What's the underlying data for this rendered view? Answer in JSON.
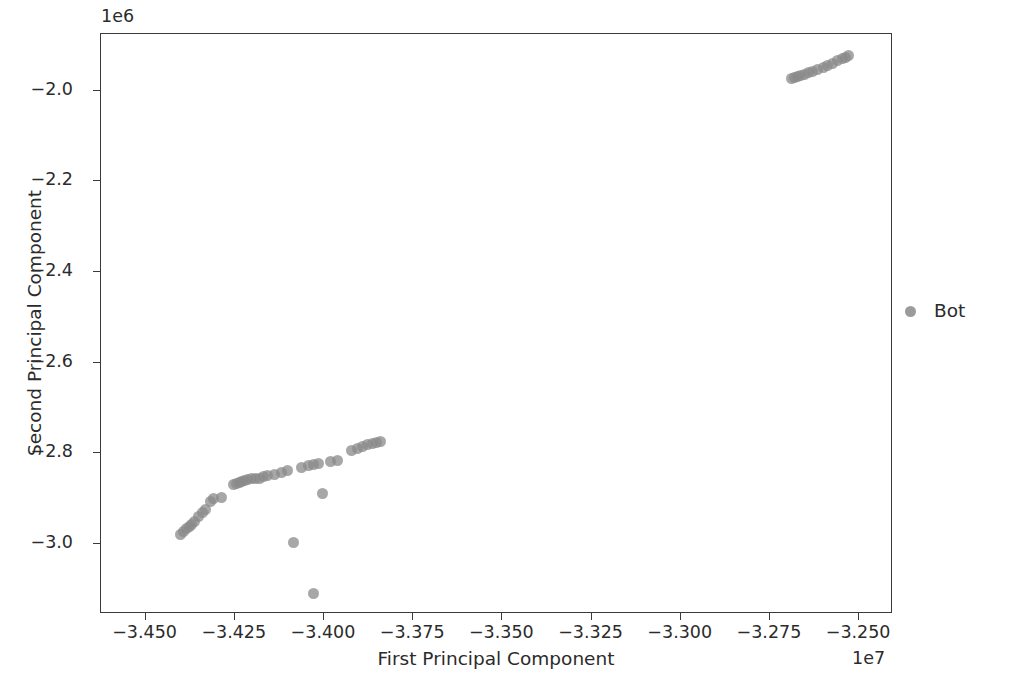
{
  "figure": {
    "background_color": "#ffffff",
    "axes_color": "#3a3a3a",
    "marker_color": "#8a8a8a"
  },
  "axis": {
    "x_title": "First Principal Component",
    "y_title": "Second Principal Component",
    "x_offset_text": "1e7",
    "y_offset_text": "1e6"
  },
  "legend": {
    "entries": [
      {
        "label": "Bot",
        "marker": "circle-marker",
        "color": "#8a8a8a"
      }
    ]
  },
  "chart_data": {
    "type": "scatter",
    "title": "",
    "xlabel": "First Principal Component",
    "ylabel": "Second Principal Component",
    "x_offset": 10000000,
    "y_offset": 1000000,
    "x_offset_label": "1e7",
    "y_offset_label": "1e6",
    "xlim": [
      -3.4625,
      -3.2405
    ],
    "ylim": [
      -3.155,
      -1.875
    ],
    "xticks": [
      -3.45,
      -3.425,
      -3.4,
      -3.375,
      -3.35,
      -3.325,
      -3.3,
      -3.275,
      -3.25
    ],
    "xticklabels": [
      "-3.450",
      "-3.425",
      "-3.400",
      "-3.375",
      "-3.350",
      "-3.325",
      "-3.300",
      "-3.275",
      "-3.250"
    ],
    "yticks": [
      -2.0,
      -2.2,
      -2.4,
      -2.6,
      -2.8,
      -3.0
    ],
    "yticklabels": [
      "-2.0",
      "-2.2",
      "-2.4",
      "-2.6",
      "-2.8",
      "-3.0"
    ],
    "grid": false,
    "legend_position": "right-outside",
    "series": [
      {
        "name": "Bot",
        "color": "#8a8a8a",
        "marker": "o",
        "marker_size": 11,
        "alpha": 0.75,
        "points": [
          [
            -3.4402,
            -2.979
          ],
          [
            -3.4393,
            -2.973
          ],
          [
            -3.4386,
            -2.967
          ],
          [
            -3.4378,
            -2.962
          ],
          [
            -3.4371,
            -2.957
          ],
          [
            -3.4362,
            -2.95
          ],
          [
            -3.4351,
            -2.94
          ],
          [
            -3.4341,
            -2.932
          ],
          [
            -3.4332,
            -2.925
          ],
          [
            -3.4319,
            -2.906
          ],
          [
            -3.431,
            -2.9
          ],
          [
            -3.4288,
            -2.898
          ],
          [
            -3.4255,
            -2.869
          ],
          [
            -3.4246,
            -2.866
          ],
          [
            -3.4238,
            -2.864
          ],
          [
            -3.423,
            -2.862
          ],
          [
            -3.4222,
            -2.86
          ],
          [
            -3.4213,
            -2.858
          ],
          [
            -3.4204,
            -2.856
          ],
          [
            -3.4193,
            -2.857
          ],
          [
            -3.4181,
            -2.855
          ],
          [
            -3.417,
            -2.852
          ],
          [
            -3.4158,
            -2.85
          ],
          [
            -3.414,
            -2.847
          ],
          [
            -3.412,
            -2.842
          ],
          [
            -3.4101,
            -2.838
          ],
          [
            -3.4062,
            -2.831
          ],
          [
            -3.4044,
            -2.828
          ],
          [
            -3.403,
            -2.826
          ],
          [
            -3.4014,
            -2.823
          ],
          [
            -3.3981,
            -2.818
          ],
          [
            -3.3963,
            -2.816
          ],
          [
            -3.3924,
            -2.795
          ],
          [
            -3.3906,
            -2.79
          ],
          [
            -3.3893,
            -2.786
          ],
          [
            -3.3878,
            -2.782
          ],
          [
            -3.3863,
            -2.779
          ],
          [
            -3.3852,
            -2.776
          ],
          [
            -3.3842,
            -2.774
          ],
          [
            -3.4005,
            -2.888
          ],
          [
            -3.4086,
            -2.997
          ],
          [
            -3.4028,
            -3.11
          ],
          [
            -3.269,
            -1.973
          ],
          [
            -3.2681,
            -1.971
          ],
          [
            -3.2672,
            -1.969
          ],
          [
            -3.2663,
            -1.967
          ],
          [
            -3.2652,
            -1.964
          ],
          [
            -3.2641,
            -1.961
          ],
          [
            -3.263,
            -1.958
          ],
          [
            -3.2617,
            -1.954
          ],
          [
            -3.26,
            -1.948
          ],
          [
            -3.2588,
            -1.944
          ],
          [
            -3.2574,
            -1.939
          ],
          [
            -3.256,
            -1.934
          ],
          [
            -3.2547,
            -1.929
          ],
          [
            -3.2538,
            -1.926
          ],
          [
            -3.253,
            -1.923
          ]
        ]
      }
    ]
  }
}
